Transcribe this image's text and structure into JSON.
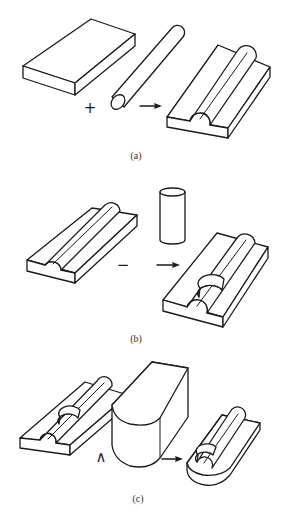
{
  "figure": {
    "panels": [
      {
        "id": "a",
        "caption": "(a)",
        "operator": "+",
        "operation": "union",
        "operands": [
          "rectangular slab",
          "horizontal cylinder"
        ],
        "result": "slab with half-cylinder ridge"
      },
      {
        "id": "b",
        "caption": "(b)",
        "operator": "−",
        "operation": "difference",
        "operands": [
          "slab with half-cylinder ridge",
          "vertical cylinder"
        ],
        "result": "ridged slab with cylindrical notch"
      },
      {
        "id": "c",
        "caption": "(c)",
        "operator": "∧",
        "operation": "intersection",
        "operands": [
          "notched ridged slab",
          "rounded block"
        ],
        "result": "rounded-end notched ridged part"
      }
    ],
    "arrow_icon": "right-arrow-icon",
    "colors": {
      "line": "#1a1a1a",
      "background": "#ffffff",
      "caption": "#333333"
    }
  }
}
